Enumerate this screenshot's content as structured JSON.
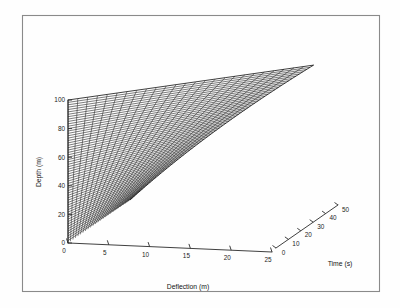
{
  "figure": {
    "background_color": "#ffffff",
    "border_color": "#8a8a8a",
    "line_color": "#111111",
    "axis_color": "#2a2a2a",
    "frame": {
      "x": 22,
      "y": 15,
      "width": 358,
      "height": 277
    }
  },
  "chart_data": {
    "type": "line",
    "subtype": "3d-mesh-surface",
    "title": "",
    "xlabel": "Deflection (m)",
    "ylabel": "Depth (m)",
    "zlabel": "Time (s)",
    "grid": false,
    "legend": "none",
    "axes": {
      "depth": {
        "label": "Depth (m)",
        "unit": "m",
        "min": 0,
        "max": 100,
        "tick_step": 20,
        "ticks": [
          0,
          20,
          40,
          60,
          80,
          100
        ],
        "tick_labels": [
          "0",
          "20",
          "40",
          "60",
          "80",
          "100"
        ],
        "orientation": "vertical-left",
        "screen_start": {
          "x": 68,
          "y": 243
        },
        "screen_end": {
          "x": 68,
          "y": 100
        }
      },
      "deflection": {
        "label": "Deflection (m)",
        "unit": "m",
        "min": 0,
        "max": 25,
        "tick_step": 5,
        "ticks": [
          0,
          5,
          10,
          15,
          20,
          25
        ],
        "tick_labels": [
          "0",
          "5",
          "10",
          "15",
          "20",
          "25"
        ],
        "orientation": "depth-axis-right-down",
        "screen_start": {
          "x": 68,
          "y": 243
        },
        "screen_end": {
          "x": 272,
          "y": 252
        }
      },
      "time": {
        "label": "Time (s)",
        "unit": "s",
        "min": 0,
        "max": 50,
        "tick_step": 10,
        "ticks": [
          0,
          10,
          20,
          30,
          40,
          50
        ],
        "tick_labels": [
          "0",
          "10",
          "20",
          "30",
          "40",
          "50"
        ],
        "orientation": "depth-axis-right-up",
        "screen_start": {
          "x": 276,
          "y": 248
        },
        "screen_end": {
          "x": 338,
          "y": 205
        }
      }
    },
    "series_note": "Each time step contributes one deflection-vs-depth curve; curves are near-linear and increase in deflection with time.",
    "time_steps": [
      0,
      2,
      4,
      6,
      8,
      10,
      12,
      14,
      16,
      18,
      20,
      22,
      24,
      26,
      28,
      30,
      32,
      34,
      36,
      38,
      40,
      42,
      44,
      46,
      48,
      50
    ],
    "depth_nodes": [
      0,
      5,
      10,
      15,
      20,
      25,
      30,
      35,
      40,
      45,
      50,
      55,
      60,
      65,
      70,
      75,
      80,
      85,
      90,
      95,
      100
    ],
    "deflection_at_max_depth_by_time": [
      0.0,
      0.9,
      1.8,
      2.7,
      3.6,
      4.5,
      5.4,
      6.3,
      7.2,
      8.1,
      9.0,
      9.9,
      10.8,
      11.7,
      12.6,
      13.5,
      14.4,
      15.3,
      16.2,
      17.1,
      18.0,
      18.9,
      19.8,
      20.7,
      21.6,
      22.5
    ],
    "series": [
      {
        "name": "lower envelope",
        "note": "minimum deflection profile, time = 0 s",
        "values": [
          0,
          0,
          0,
          0,
          0,
          0,
          0,
          0,
          0,
          0,
          0,
          0,
          0,
          0,
          0,
          0,
          0,
          0,
          0,
          0,
          0
        ]
      },
      {
        "name": "upper envelope",
        "note": "maximum deflection profile, time = 50 s",
        "values": [
          0,
          1.1,
          2.3,
          3.4,
          4.5,
          5.6,
          6.8,
          7.9,
          9.0,
          10.1,
          11.3,
          12.4,
          13.5,
          14.6,
          15.8,
          16.9,
          18.0,
          19.1,
          20.3,
          21.4,
          22.5
        ]
      }
    ]
  },
  "labels": {
    "depth_title": "Depth (m)",
    "deflection_title": "Deflection (m)",
    "time_title": "Time (s)",
    "depth_ticks": [
      "0",
      "20",
      "40",
      "60",
      "80",
      "100"
    ],
    "deflection_ticks": [
      "0",
      "5",
      "10",
      "15",
      "20",
      "25"
    ],
    "time_ticks": [
      "0",
      "10",
      "20",
      "30",
      "40",
      "50"
    ]
  }
}
